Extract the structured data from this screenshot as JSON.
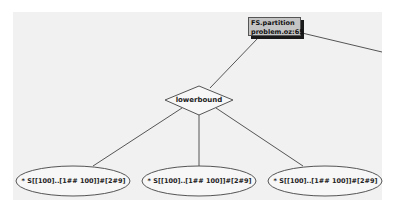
{
  "diagram": {
    "type": "search-tree",
    "colors": {
      "outer_background": "#ffffff",
      "canvas_background": "#f1f1f1",
      "edge": "#555555",
      "process_box_fill": "#c4c4c4",
      "process_box_shadow": "#1a1a1a"
    },
    "root": {
      "shape": "rectangle",
      "line1": "FS.partition",
      "line2": "problem.oz:65"
    },
    "choice": {
      "shape": "diamond",
      "label": "lowerbound"
    },
    "leaves": [
      {
        "shape": "ellipse",
        "label": "* S[[100]..[1## 100]]#[2#9]"
      },
      {
        "shape": "ellipse",
        "label": "* S[[100]..[1## 100]]#[2#9]"
      },
      {
        "shape": "ellipse",
        "label": "* S[[100]..[1## 100]]#[2#9]"
      }
    ]
  }
}
